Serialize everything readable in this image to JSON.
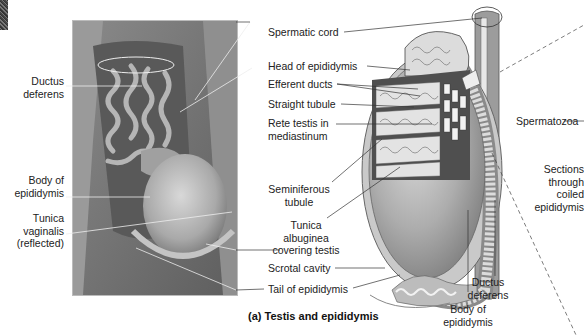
{
  "figure": {
    "caption": "(a) Testis and epididymis"
  },
  "photo_labels": {
    "ductus_deferens": [
      "Ductus",
      "deferens"
    ],
    "body_of_epididymis": [
      "Body of",
      "epididymis"
    ],
    "tunica_vaginalis": [
      "Tunica",
      "vaginalis",
      "(reflected)"
    ]
  },
  "center_labels": {
    "spermatic_cord": "Spermatic cord",
    "head_of_epididymis": "Head of epididymis",
    "efferent_ducts": "Efferent ducts",
    "straight_tubule": "Straight tubule",
    "rete_testis": [
      "Rete testis in",
      "mediastinum"
    ],
    "seminiferous_tubule": [
      "Seminiferous",
      "tubule"
    ],
    "tunica_albuginea": [
      "Tunica",
      "albuginea",
      "covering testis"
    ],
    "scrotal_cavity": "Scrotal cavity",
    "tail_of_epididymis": "Tail of epididymis"
  },
  "right_labels": {
    "ductus_deferens": [
      "Ductus",
      "deferens"
    ],
    "body_of_epididymis": [
      "Body of",
      "epididymis"
    ],
    "spermatozoa": "Spermatozoa",
    "sections_through": [
      "Sections",
      "through",
      "coiled",
      "epididymis"
    ]
  },
  "colors": {
    "photo_tissue": "#7a7a7a",
    "testis_fill": "#a8a8a8",
    "tubule_fill": "#e6e6e6",
    "leader_line": "#333333"
  }
}
